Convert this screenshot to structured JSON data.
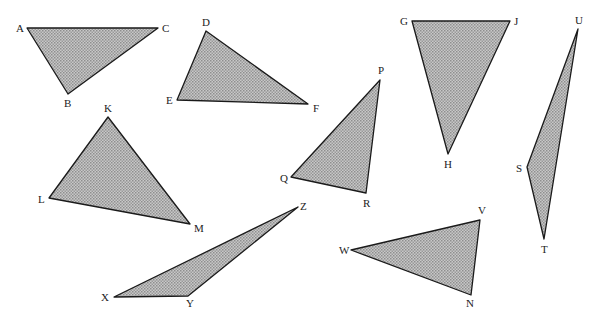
{
  "figure": {
    "background": "#ffffff",
    "fill_color": "#b5b5b5",
    "stroke_color": "#1a1a1a",
    "pattern": "crosshatch",
    "triangles": [
      {
        "name": "ABC",
        "vertices": [
          {
            "label": "A",
            "x": 27,
            "y": 28,
            "lx": 16,
            "ly": 32
          },
          {
            "label": "C",
            "x": 158,
            "y": 28,
            "lx": 162,
            "ly": 32
          },
          {
            "label": "B",
            "x": 68,
            "y": 94,
            "lx": 64,
            "ly": 107
          }
        ]
      },
      {
        "name": "DEF",
        "vertices": [
          {
            "label": "D",
            "x": 206,
            "y": 31,
            "lx": 202,
            "ly": 26
          },
          {
            "label": "E",
            "x": 177,
            "y": 100,
            "lx": 166,
            "ly": 104
          },
          {
            "label": "F",
            "x": 308,
            "y": 104,
            "lx": 313,
            "ly": 112
          }
        ]
      },
      {
        "name": "GHJ",
        "vertices": [
          {
            "label": "G",
            "x": 412,
            "y": 21,
            "lx": 400,
            "ly": 25
          },
          {
            "label": "J",
            "x": 510,
            "y": 21,
            "lx": 514,
            "ly": 25
          },
          {
            "label": "H",
            "x": 448,
            "y": 154,
            "lx": 444,
            "ly": 168
          }
        ]
      },
      {
        "name": "STU",
        "vertices": [
          {
            "label": "U",
            "x": 578,
            "y": 29,
            "lx": 575,
            "ly": 24
          },
          {
            "label": "S",
            "x": 527,
            "y": 167,
            "lx": 516,
            "ly": 172
          },
          {
            "label": "T",
            "x": 544,
            "y": 239,
            "lx": 541,
            "ly": 253
          }
        ]
      },
      {
        "name": "PQR",
        "vertices": [
          {
            "label": "P",
            "x": 380,
            "y": 80,
            "lx": 378,
            "ly": 74
          },
          {
            "label": "Q",
            "x": 291,
            "y": 177,
            "lx": 280,
            "ly": 182
          },
          {
            "label": "R",
            "x": 366,
            "y": 193,
            "lx": 363,
            "ly": 207
          }
        ]
      },
      {
        "name": "KLM",
        "vertices": [
          {
            "label": "K",
            "x": 108,
            "y": 117,
            "lx": 104,
            "ly": 112
          },
          {
            "label": "L",
            "x": 49,
            "y": 198,
            "lx": 38,
            "ly": 203
          },
          {
            "label": "M",
            "x": 190,
            "y": 224,
            "lx": 194,
            "ly": 232
          }
        ]
      },
      {
        "name": "XYZ",
        "vertices": [
          {
            "label": "Z",
            "x": 298,
            "y": 207,
            "lx": 300,
            "ly": 210
          },
          {
            "label": "X",
            "x": 114,
            "y": 297,
            "lx": 101,
            "ly": 301
          },
          {
            "label": "Y",
            "x": 188,
            "y": 296,
            "lx": 186,
            "ly": 307
          }
        ]
      },
      {
        "name": "VWN",
        "vertices": [
          {
            "label": "V",
            "x": 480,
            "y": 220,
            "lx": 478,
            "ly": 214
          },
          {
            "label": "W",
            "x": 351,
            "y": 250,
            "lx": 339,
            "ly": 254
          },
          {
            "label": "N",
            "x": 471,
            "y": 295,
            "lx": 466,
            "ly": 307
          }
        ]
      }
    ]
  }
}
